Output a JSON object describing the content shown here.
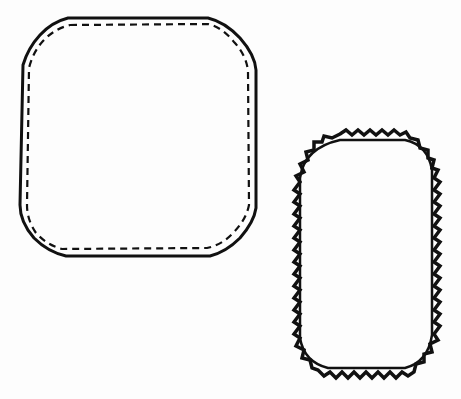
{
  "figure": {
    "colors": {
      "background": "#fdfdfd",
      "stroke": "#111111"
    },
    "shapes": [
      {
        "name": "rounded-square-patch",
        "stitch": "dashed straight stitch",
        "edge": "solid"
      },
      {
        "name": "rounded-rectangle-patch",
        "stitch": "zigzag satin stitch",
        "edge": "zigzag"
      }
    ]
  }
}
